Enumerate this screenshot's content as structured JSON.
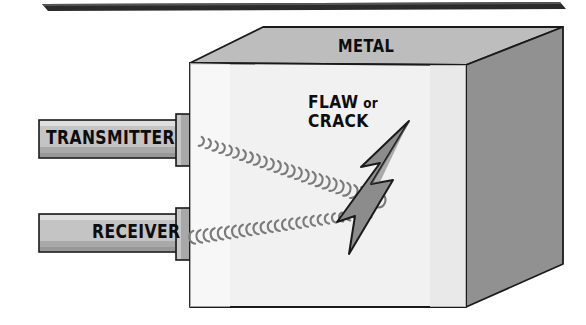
{
  "diagram": {
    "title_visible": false,
    "labels": {
      "metal": "METAL",
      "flaw_line1_main": "FLAW",
      "flaw_line1_conj": "or",
      "flaw_line2": "CRACK",
      "transmitter": "TRANSMITTER",
      "receiver": "RECEIVER"
    },
    "colors": {
      "outline": "#1a1a1a",
      "cube_front_face": "#f1f1f1",
      "cube_top_face": "#bdbdbd",
      "cube_right_face": "#919191",
      "probe_bar_light": "#d8d8d8",
      "probe_bar_mid": "#b5b5b5",
      "probe_bar_dark": "#9a9a9a",
      "connector_block": "#a8a8a8",
      "flaw_fill": "#8c8c8c",
      "wave_stroke": "#7a7a7a",
      "page_background": "#ffffff",
      "scan_edge_artifact": "#2b2b2b"
    },
    "elements": {
      "cube_name": "metal-block",
      "flaw_name": "flaw-crack-bolt",
      "transmitter_probe_name": "transmitter-probe",
      "receiver_probe_name": "receiver-probe",
      "outgoing_wave_name": "ultrasonic-outgoing-wave",
      "reflected_wave_name": "ultrasonic-reflected-wave"
    }
  }
}
